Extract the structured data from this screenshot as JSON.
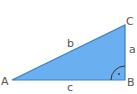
{
  "diagram": {
    "vertices": {
      "A": {
        "label": "A",
        "x": 12,
        "y": 80
      },
      "B": {
        "label": "B",
        "x": 125,
        "y": 80
      },
      "C": {
        "label": "C",
        "x": 125,
        "y": 25
      }
    },
    "sides": {
      "a": {
        "label": "a"
      },
      "b": {
        "label": "b"
      },
      "c": {
        "label": "c"
      }
    },
    "right_angle_marker": {
      "at": "B",
      "symbol": "·"
    },
    "colors": {
      "fill": "#6ab0f0",
      "stroke": "#3b7fc4",
      "label": "#555555",
      "marker": "#333333"
    }
  }
}
